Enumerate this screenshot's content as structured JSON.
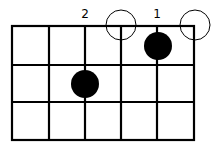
{
  "diagram": {
    "type": "chord-diagram",
    "strings": 6,
    "frets_shown": 3,
    "finger_labels": [
      {
        "string": 3,
        "label": "2"
      },
      {
        "string": 5,
        "label": "1"
      }
    ],
    "open_strings": [
      4,
      6
    ],
    "fretted_notes": [
      {
        "string": 5,
        "fret": 1,
        "finger": "1"
      },
      {
        "string": 3,
        "fret": 2,
        "finger": "2"
      }
    ],
    "colors": {
      "line": "#000000",
      "dot": "#000000",
      "background": "#ffffff"
    }
  }
}
